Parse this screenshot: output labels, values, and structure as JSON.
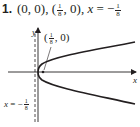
{
  "problem": {
    "number": "1.",
    "vertex": "(0, 0)",
    "focus_open": "(",
    "focus_num": "1",
    "focus_den": "8",
    "focus_close": ", 0)",
    "directrix_lhs": "x",
    "directrix_eq": " = −",
    "directrix_num": "1",
    "directrix_den": "8",
    "sep": ", "
  },
  "figure": {
    "y_axis_label": "y",
    "x_axis_label": "x",
    "focus_label_open": "(",
    "focus_label_num": "1",
    "focus_label_den": "8",
    "focus_label_close": ", 0)",
    "directrix_label_lhs": "x",
    "directrix_label_eq": " = −",
    "directrix_label_num": "1",
    "directrix_label_den": "8"
  },
  "colors": {
    "ink": "#231f20",
    "background": "#ffffff"
  }
}
